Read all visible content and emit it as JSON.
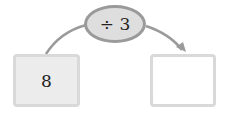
{
  "diagram": {
    "start_value": "8",
    "operation": "÷ 3",
    "result_value": "",
    "colors": {
      "arrow": "#9a9a9a",
      "oval_fill": "#dedede",
      "box_border": "#d9d9d9",
      "start_fill": "#ececec"
    }
  }
}
